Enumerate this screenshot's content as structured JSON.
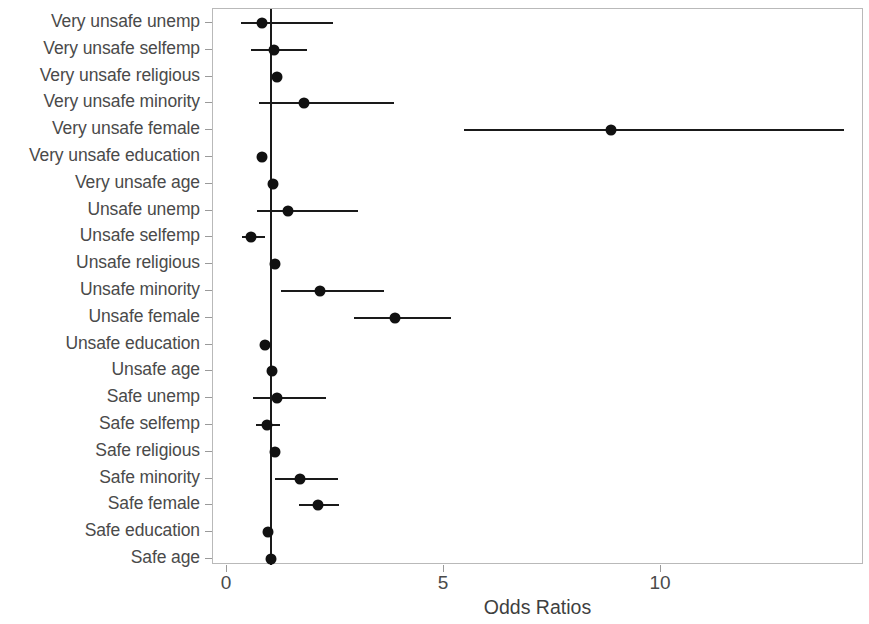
{
  "chart_data": {
    "type": "scatter",
    "subtype": "forest-plot",
    "title": "",
    "xlabel": "Odds Ratios",
    "ylabel": "",
    "xlim": [
      0,
      14.85
    ],
    "xticks": [
      0,
      5,
      10
    ],
    "xticklabels": [
      "0",
      "5",
      "10"
    ],
    "grid": false,
    "legend": null,
    "reference_line": 1,
    "categories": [
      "Very unsafe unemp",
      "Very unsafe selfemp",
      "Very unsafe religious",
      "Very unsafe minority",
      "Very unsafe female",
      "Very unsafe education",
      "Very unsafe age",
      "Unsafe unemp",
      "Unsafe selfemp",
      "Unsafe religious",
      "Unsafe minority",
      "Unsafe female",
      "Unsafe education",
      "Unsafe age",
      "Safe unemp",
      "Safe selfemp",
      "Safe religious",
      "Safe minority",
      "Safe female",
      "Safe education",
      "Safe age"
    ],
    "points": [
      {
        "label": "Very unsafe unemp",
        "odds_ratio": 0.8,
        "ci_low": 0.32,
        "ci_high": 2.44
      },
      {
        "label": "Very unsafe selfemp",
        "odds_ratio": 1.08,
        "ci_low": 0.56,
        "ci_high": 1.85
      },
      {
        "label": "Very unsafe religious",
        "odds_ratio": 1.15,
        "ci_low": 1.15,
        "ci_high": 1.15
      },
      {
        "label": "Very unsafe minority",
        "odds_ratio": 1.77,
        "ci_low": 0.74,
        "ci_high": 3.85
      },
      {
        "label": "Very unsafe female",
        "odds_ratio": 8.85,
        "ci_low": 5.46,
        "ci_high": 14.22
      },
      {
        "label": "Very unsafe education",
        "odds_ratio": 0.8,
        "ci_low": 0.8,
        "ci_high": 0.8
      },
      {
        "label": "Very unsafe age",
        "odds_ratio": 1.05,
        "ci_low": 1.05,
        "ci_high": 1.05
      },
      {
        "label": "Unsafe unemp",
        "odds_ratio": 1.4,
        "ci_low": 0.69,
        "ci_high": 3.02
      },
      {
        "label": "Unsafe selfemp",
        "odds_ratio": 0.55,
        "ci_low": 0.35,
        "ci_high": 0.87
      },
      {
        "label": "Unsafe religious",
        "odds_ratio": 1.1,
        "ci_low": 1.1,
        "ci_high": 1.1
      },
      {
        "label": "Unsafe minority",
        "odds_ratio": 2.14,
        "ci_low": 1.24,
        "ci_high": 3.62
      },
      {
        "label": "Unsafe female",
        "odds_ratio": 3.87,
        "ci_low": 2.93,
        "ci_high": 5.16
      },
      {
        "label": "Unsafe education",
        "odds_ratio": 0.87,
        "ci_low": 0.87,
        "ci_high": 0.87
      },
      {
        "label": "Unsafe age",
        "odds_ratio": 1.03,
        "ci_low": 1.03,
        "ci_high": 1.03
      },
      {
        "label": "Safe unemp",
        "odds_ratio": 1.15,
        "ci_low": 0.6,
        "ci_high": 2.28
      },
      {
        "label": "Safe selfemp",
        "odds_ratio": 0.92,
        "ci_low": 0.66,
        "ci_high": 1.22
      },
      {
        "label": "Safe religious",
        "odds_ratio": 1.1,
        "ci_low": 1.1,
        "ci_high": 1.1
      },
      {
        "label": "Safe minority",
        "odds_ratio": 1.68,
        "ci_low": 1.1,
        "ci_high": 2.55
      },
      {
        "label": "Safe female",
        "odds_ratio": 2.1,
        "ci_low": 1.66,
        "ci_high": 2.58
      },
      {
        "label": "Safe education",
        "odds_ratio": 0.95,
        "ci_low": 0.95,
        "ci_high": 0.95
      },
      {
        "label": "Safe age",
        "odds_ratio": 1.02,
        "ci_low": 1.02,
        "ci_high": 1.02
      }
    ],
    "colors": {
      "point": "#111111",
      "ci": "#1a1a1a",
      "reference_line": "#1a1a1a",
      "axis": "#9a9a9a",
      "text": "#4a4a4a",
      "background": "#ffffff"
    }
  }
}
